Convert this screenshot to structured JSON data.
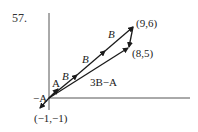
{
  "problem_number": "57.",
  "labels": {
    "A": "A",
    "neg_A": "−A",
    "B1": "B",
    "B2": "B",
    "B3": "B",
    "three_B_minus_A": "3B−A",
    "point_9_6": "(9,6)",
    "point_8_5": "(8,5)",
    "point_neg1_neg1": "(−1,−1)"
  },
  "colors": {
    "stroke": "#1a1a1a",
    "axis": "#444444",
    "text": "#222222"
  }
}
